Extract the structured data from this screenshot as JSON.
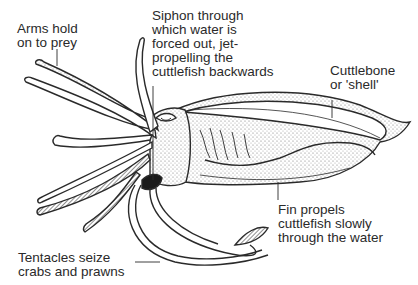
{
  "diagram": {
    "subject": "Cuttlefish",
    "labels": {
      "arms": "Arms hold\non to prey",
      "siphon": "Siphon through\nwhich water is\nforced out, jet-\npropelling the\ncuttlefish backwards",
      "cuttlebone": "Cuttlebone\nor 'shell'",
      "fin": "Fin propels\ncuttlefish slowly\nthrough the water",
      "tentacles": "Tentacles seize\ncrabs and prawns"
    },
    "colors": {
      "ink": "#2a2a2a",
      "fill": "#ffffff",
      "shade": "#6a6a6a",
      "dark": "#1a1a1a"
    }
  }
}
